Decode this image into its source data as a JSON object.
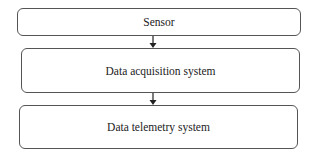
{
  "diagram": {
    "type": "flowchart",
    "direction": "top-to-bottom",
    "nodes": [
      {
        "id": "sensor",
        "label": "Sensor"
      },
      {
        "id": "daq",
        "label": "Data acquisition system"
      },
      {
        "id": "telemetry",
        "label": "Data telemetry system"
      }
    ],
    "edges": [
      {
        "from": "sensor",
        "to": "daq"
      },
      {
        "from": "daq",
        "to": "telemetry"
      }
    ],
    "colors": {
      "stroke": "#555555",
      "text": "#222222",
      "background": "#ffffff"
    }
  }
}
